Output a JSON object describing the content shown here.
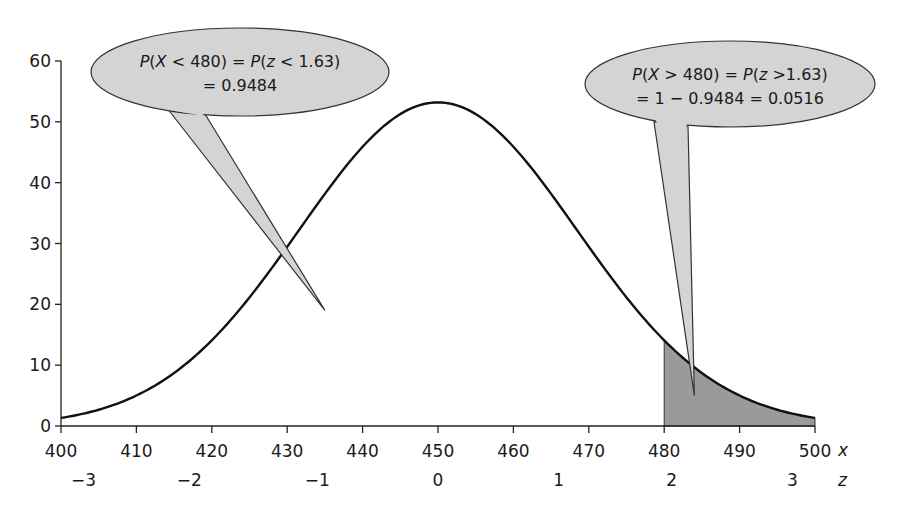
{
  "chart_data": {
    "type": "area",
    "title": "",
    "xlabel": "x",
    "zlabel": "z",
    "ylabel": "",
    "xlim": [
      400,
      500
    ],
    "ylim": [
      0,
      60
    ],
    "grid": false,
    "x_ticks": [
      400,
      410,
      420,
      430,
      440,
      450,
      460,
      470,
      480,
      490,
      500
    ],
    "y_ticks": [
      0,
      10,
      20,
      30,
      40,
      50,
      60
    ],
    "z_ticks": [
      {
        "label": "−3",
        "x": 403
      },
      {
        "label": "−2",
        "x": 417
      },
      {
        "label": "−1",
        "x": 434
      },
      {
        "label": "0",
        "x": 450
      },
      {
        "label": "1",
        "x": 466
      },
      {
        "label": "2",
        "x": 481
      },
      {
        "label": "3",
        "x": 497
      }
    ],
    "curve": {
      "mean": 450,
      "sd": 18.4,
      "peak": 53.2,
      "x": [
        400,
        410,
        420,
        430,
        440,
        450,
        460,
        470,
        480,
        490,
        500
      ],
      "y": [
        2,
        5,
        13,
        28,
        45,
        53.2,
        45,
        28,
        14,
        5,
        2
      ]
    },
    "shaded_region": {
      "from": 480,
      "to": 500,
      "color": "#9a9a9a"
    },
    "annotations": [
      {
        "id": "left",
        "line1": [
          "P(",
          "X",
          " < 480) = ",
          "P",
          "(",
          "z",
          " < 1.63)"
        ],
        "line2": "= 0.9484",
        "pointer_to": {
          "x": 435,
          "y": 19
        }
      },
      {
        "id": "right",
        "line1": [
          "P(",
          "X",
          " > 480) = ",
          "P",
          "(",
          "z",
          " >1.63)"
        ],
        "line2": "= 1 − 0.9484 = 0.0516",
        "pointer_to": {
          "x": 484,
          "y": 5
        }
      }
    ]
  },
  "colors": {
    "bubble_fill": "#d4d4d4",
    "shade_fill": "#9a9a9a",
    "curve": "#111111",
    "axis": "#222222"
  }
}
